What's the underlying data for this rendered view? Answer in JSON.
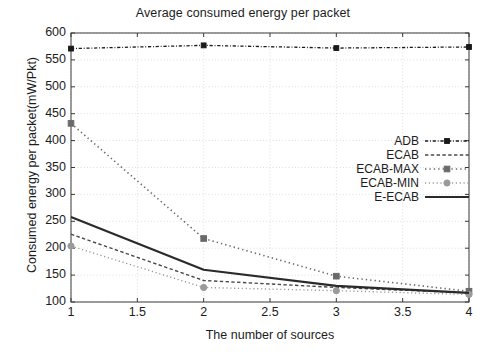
{
  "chart_data": {
    "type": "line",
    "title": "Average consumed energy per packet",
    "xlabel": "The number of sources",
    "ylabel": "Consumed energy per packet(mW/Pkt)",
    "x": [
      1,
      2,
      3,
      4
    ],
    "xlim": [
      1,
      4
    ],
    "ylim": [
      100,
      600
    ],
    "xticks": [
      "1",
      "1.5",
      "2",
      "2.5",
      "3",
      "3.5",
      "4"
    ],
    "xtick_values": [
      1,
      1.5,
      2,
      2.5,
      3,
      3.5,
      4
    ],
    "yticks": [
      "100",
      "150",
      "200",
      "250",
      "300",
      "350",
      "400",
      "450",
      "500",
      "550",
      "600"
    ],
    "ytick_values": [
      100,
      150,
      200,
      250,
      300,
      350,
      400,
      450,
      500,
      550,
      600
    ],
    "grid": true,
    "legend_position": "center-right",
    "series": [
      {
        "name": "ADB",
        "values": [
          571,
          577,
          572,
          574
        ],
        "color": "#1a1a1a",
        "dash": "dashdot",
        "marker": "square-small",
        "width": 1.3
      },
      {
        "name": "ECAB",
        "values": [
          226,
          140,
          127,
          117
        ],
        "color": "#4a4a4a",
        "dash": "dashed",
        "marker": "none",
        "width": 1.4
      },
      {
        "name": "ECAB-MAX",
        "values": [
          432,
          218,
          148,
          120
        ],
        "color": "#6a6a6a",
        "dash": "dotted",
        "marker": "square",
        "width": 1.6
      },
      {
        "name": "ECAB-MIN",
        "values": [
          204,
          127,
          121,
          114
        ],
        "color": "#9a9a9a",
        "dash": "dotted",
        "marker": "circle",
        "width": 1.4
      },
      {
        "name": "E-ECAB",
        "values": [
          258,
          160,
          130,
          117
        ],
        "color": "#2a2a2a",
        "dash": "solid",
        "marker": "none",
        "width": 2.2
      }
    ]
  }
}
